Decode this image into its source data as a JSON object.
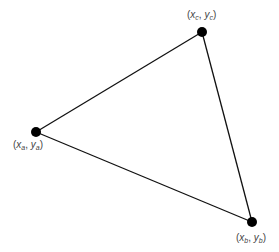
{
  "diagram": {
    "type": "triangle",
    "stroke_color": "#111111",
    "vertex_color": "#000000",
    "label_color": "#444444",
    "vertices": [
      {
        "id": "a",
        "cx": 36,
        "cy": 132,
        "label": {
          "x": "x",
          "xsub": "a",
          "y": "y",
          "ysub": "a",
          "left": 13,
          "top": 139
        }
      },
      {
        "id": "b",
        "cx": 252,
        "cy": 222,
        "label": {
          "x": "x",
          "xsub": "b",
          "y": "y",
          "ysub": "b",
          "left": 236,
          "top": 232
        }
      },
      {
        "id": "c",
        "cx": 202,
        "cy": 32,
        "label": {
          "x": "x",
          "xsub": "c",
          "y": "y",
          "ysub": "c",
          "left": 187,
          "top": 9
        }
      }
    ],
    "edges": [
      [
        "a",
        "c"
      ],
      [
        "c",
        "b"
      ],
      [
        "b",
        "a"
      ]
    ]
  },
  "labels": {
    "a": {
      "open": "(",
      "x": "x",
      "xsub": "a",
      "sep": ", ",
      "y": "y",
      "ysub": "a",
      "close": ")"
    },
    "b": {
      "open": "(",
      "x": "x",
      "xsub": "b",
      "sep": ", ",
      "y": "y",
      "ysub": "b",
      "close": ")"
    },
    "c": {
      "open": "(",
      "x": "x",
      "xsub": "c",
      "sep": ", ",
      "y": "y",
      "ysub": "c",
      "close": ")"
    }
  }
}
